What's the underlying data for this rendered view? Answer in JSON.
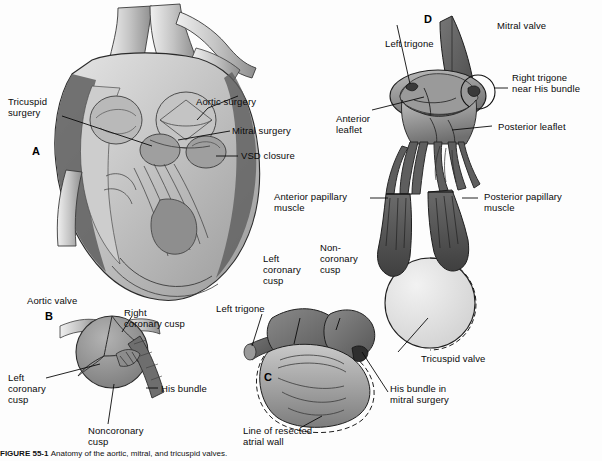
{
  "figure": {
    "background": "#fdfdfd",
    "ink": "#0a0a0a"
  },
  "panels": [
    {
      "id": "A",
      "letter": "A",
      "x": 32,
      "y": 145
    },
    {
      "id": "B",
      "letter": "B",
      "x": 45,
      "y": 310
    },
    {
      "id": "C",
      "letter": "C",
      "x": 264,
      "y": 371
    },
    {
      "id": "D",
      "letter": "D",
      "x": 424,
      "y": 13
    }
  ],
  "labels": {
    "a_tricuspid_surgery": "Tricuspid\nsurgery",
    "a_aortic_surgery": "Aortic surgery",
    "a_mitral_surgery": "Mitral surgery",
    "a_vsd_closure": "VSD closure",
    "b_aortic_valve": "Aortic valve",
    "b_right_coronary_cusp": "Right\ncoronary cusp",
    "b_left_coronary_cusp": "Left\ncoronary\ncusp",
    "b_noncoronary_cusp": "Noncoronary\ncusp",
    "b_his_bundle": "His bundle",
    "c_left_trigone": "Left trigone",
    "c_left_coronary_cusp": "Left\ncoronary\ncusp",
    "c_noncoronary_cusp": "Non-\ncoronary\ncusp",
    "c_tricuspid_valve": "Tricuspid valve",
    "c_his_bundle_mitral": "His bundle in\nmitral surgery",
    "c_line_resected": "Line of resected\natrial wall",
    "d_mitral_valve": "Mitral valve",
    "d_left_trigone": "Left trigone",
    "d_right_trigone": "Right trigone\nnear His bundle",
    "d_anterior_leaflet": "Anterior\nleaflet",
    "d_posterior_leaflet": "Posterior leaflet",
    "d_anterior_papillary": "Anterior papillary\nmuscle",
    "d_posterior_papillary": "Posterior papillary\nmuscle"
  },
  "caption": {
    "label": "FIGURE 55-1",
    "text": "Anatomy of the aortic, mitral, and tricuspid valves."
  },
  "colors": {
    "darkest": "#4a4a4a",
    "dark": "#6e6e6e",
    "mid": "#8f8f8f",
    "light": "#b5b5b5",
    "lighter": "#d2d2d2",
    "lightest": "#e8e8e8",
    "outline": "#1a1a1a"
  }
}
